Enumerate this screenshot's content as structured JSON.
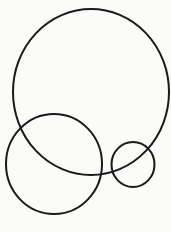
{
  "diagram": {
    "background": "#fbfbf9",
    "stroke_color": "#1a1a1a",
    "stroke_width": 2,
    "circles": [
      {
        "name": "large-circle",
        "cx": 91,
        "cy": 92,
        "rx": 78,
        "ry": 83
      },
      {
        "name": "medium-circle",
        "cx": 54,
        "cy": 164,
        "rx": 48,
        "ry": 50
      },
      {
        "name": "small-circle",
        "cx": 133,
        "cy": 164.5,
        "rx": 21.5,
        "ry": 22.5
      }
    ]
  }
}
